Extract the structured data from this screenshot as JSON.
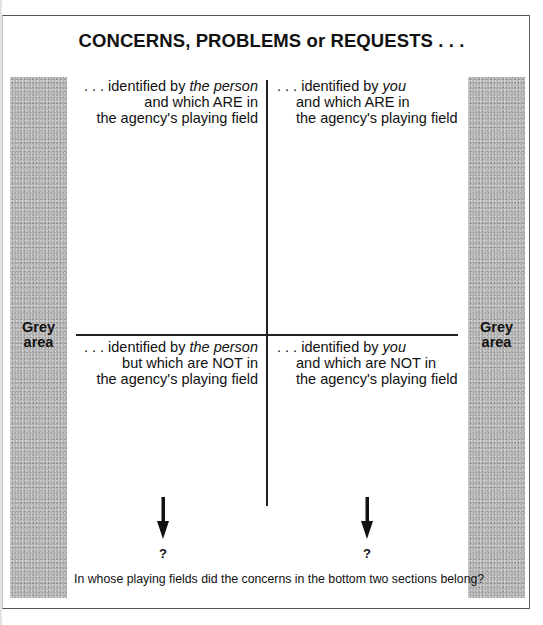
{
  "title": "CONCERNS, PROBLEMS or REQUESTS . . .",
  "grey_area": {
    "left_label_line1": "Grey",
    "left_label_line2": "area",
    "right_label_line1": "Grey",
    "right_label_line2": "area",
    "color": "#b4b4b4"
  },
  "quadrants": {
    "top_left": {
      "prefix": ". . . identified by ",
      "emphasis": "the person",
      "line2": "and which ARE in",
      "line3": "the agency's playing field"
    },
    "top_right": {
      "prefix": ". . . identified by ",
      "emphasis": "you",
      "line2": "and which ARE in",
      "line3": "the agency's playing field"
    },
    "bottom_left": {
      "prefix": ". . . identified by ",
      "emphasis": "the person",
      "line2": "but which are NOT in",
      "line3": "the agency's playing field"
    },
    "bottom_right": {
      "prefix": ". . . identified by ",
      "emphasis": "you",
      "line2": "and which are NOT in",
      "line3": "the agency's playing field"
    }
  },
  "arrows": {
    "left": {
      "icon": "down-arrow-icon",
      "label": "?"
    },
    "right": {
      "icon": "down-arrow-icon",
      "label": "?"
    }
  },
  "footer_question": "In whose playing fields did the concerns in the bottom two sections belong?"
}
